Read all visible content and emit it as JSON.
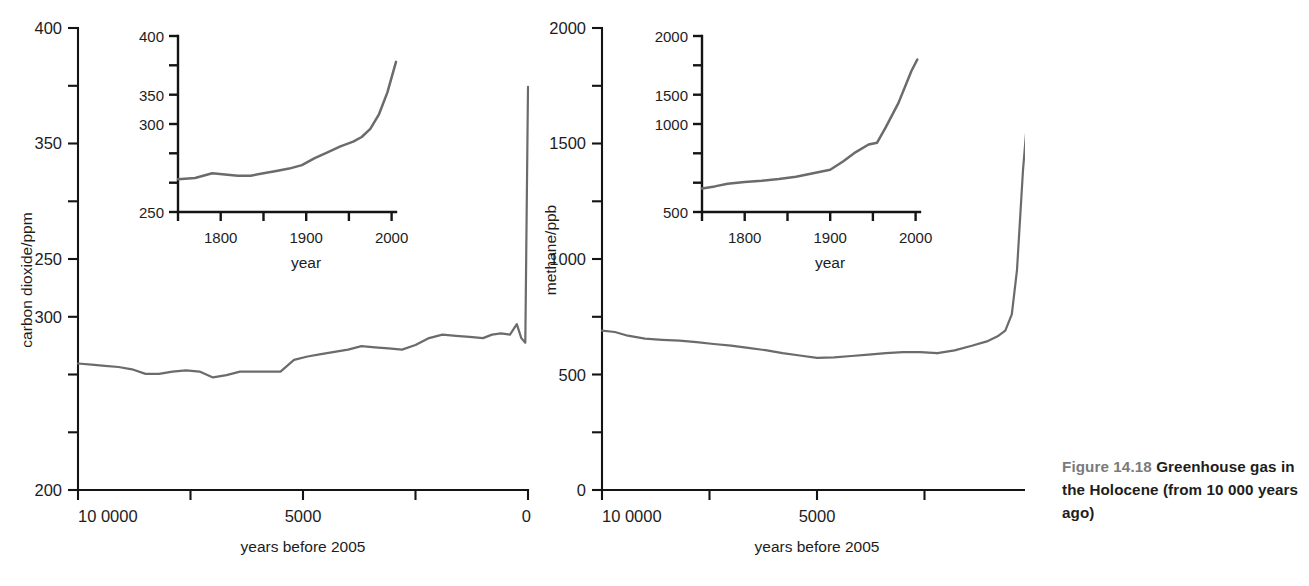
{
  "caption": {
    "figure_number": "Figure 14.18",
    "text": " Greenhouse gas in the Holocene (from 10 000 years ago)"
  },
  "chart_data": [
    {
      "id": "co2_main",
      "type": "line",
      "title": "",
      "xlabel": "years before 2005",
      "ylabel": "carbon dioxide/ppm",
      "xlim": [
        10000,
        0
      ],
      "ylim": [
        200,
        400
      ],
      "x_reversed": true,
      "grid": false,
      "legend": "none",
      "xticks": [
        10000,
        7500,
        5000,
        2500,
        0
      ],
      "xtick_labels": [
        "10 0000",
        "",
        "5000",
        "",
        "0"
      ],
      "yticks": [
        200,
        225,
        250,
        275,
        300,
        325,
        350,
        375,
        400
      ],
      "ytick_labels": [
        "200",
        "",
        "250",
        "",
        "300",
        "",
        "350",
        "",
        "400"
      ],
      "x": [
        10000,
        9700,
        9400,
        9100,
        8800,
        8500,
        8200,
        7900,
        7600,
        7300,
        7000,
        6700,
        6400,
        6100,
        5800,
        5500,
        5200,
        4900,
        4600,
        4300,
        4000,
        3700,
        3400,
        3100,
        2800,
        2500,
        2200,
        1900,
        1600,
        1300,
        1000,
        800,
        600,
        400,
        250,
        150,
        60,
        0
      ],
      "y": [
        255,
        254.5,
        254,
        253.5,
        252.5,
        250.5,
        250.5,
        251.5,
        252,
        251.5,
        249,
        250,
        251.5,
        251.5,
        251.5,
        251.5,
        256.5,
        258,
        259,
        260,
        261,
        262.5,
        262,
        261.5,
        261,
        263,
        266,
        267.5,
        267,
        266.5,
        266,
        267.5,
        268,
        267.5,
        272,
        266,
        264,
        375
      ]
    },
    {
      "id": "co2_inset",
      "type": "line",
      "title": "",
      "xlabel": "year",
      "ylabel": "",
      "xlim": [
        1750,
        2005
      ],
      "ylim": [
        250,
        400
      ],
      "grid": false,
      "legend": "none",
      "xticks": [
        1750,
        1800,
        1850,
        1900,
        1950,
        2000
      ],
      "xtick_labels": [
        "",
        "1800",
        "",
        "1900",
        "",
        "2000"
      ],
      "yticks": [
        250,
        275,
        300,
        325,
        350,
        375,
        400
      ],
      "ytick_labels": [
        "250",
        "",
        "300",
        "",
        "350",
        "",
        "400"
      ],
      "x": [
        1750,
        1770,
        1790,
        1805,
        1820,
        1835,
        1850,
        1865,
        1880,
        1895,
        1910,
        1925,
        1940,
        1955,
        1965,
        1975,
        1985,
        1995,
        2005
      ],
      "y": [
        278,
        279,
        283,
        282,
        281,
        281,
        283,
        285,
        287,
        290,
        296,
        301,
        306,
        310,
        314,
        321,
        333,
        352,
        378
      ]
    },
    {
      "id": "ch4_main",
      "type": "line",
      "title": "",
      "xlabel": "years before 2005",
      "ylabel": "methane/ppb",
      "xlim": [
        10000,
        0
      ],
      "ylim": [
        0,
        2000
      ],
      "x_reversed": true,
      "grid": false,
      "legend": "none",
      "xticks": [
        10000,
        7500,
        5000,
        2500,
        0
      ],
      "xtick_labels": [
        "10 0000",
        "",
        "5000",
        "",
        "0"
      ],
      "yticks": [
        0,
        250,
        500,
        750,
        1000,
        1250,
        1500,
        1750,
        2000
      ],
      "ytick_labels": [
        "0",
        "",
        "500",
        "",
        "1000",
        "",
        "1500",
        "",
        "2000"
      ],
      "x": [
        10000,
        9700,
        9400,
        9000,
        8600,
        8200,
        7800,
        7400,
        7000,
        6600,
        6200,
        5800,
        5400,
        5000,
        4600,
        4200,
        3800,
        3400,
        3000,
        2600,
        2200,
        1800,
        1400,
        1000,
        700,
        450,
        250,
        120,
        40,
        0
      ],
      "y": [
        690,
        684,
        668,
        655,
        650,
        646,
        640,
        632,
        625,
        615,
        605,
        592,
        582,
        572,
        574,
        580,
        586,
        592,
        597,
        597,
        592,
        598,
        610,
        625,
        645,
        663,
        690,
        760,
        1350,
        1700
      ]
    },
    {
      "id": "ch4_inset",
      "type": "line",
      "title": "",
      "xlabel": "year",
      "ylabel": "",
      "xlim": [
        1750,
        2005
      ],
      "ylim": [
        500,
        2000
      ],
      "grid": false,
      "legend": "none",
      "xticks": [
        1750,
        1800,
        1850,
        1900,
        1950,
        2000
      ],
      "xtick_labels": [
        "",
        "1800",
        "",
        "1900",
        "",
        "2000"
      ],
      "yticks": [
        500,
        750,
        1000,
        1250,
        1500,
        1750,
        2000
      ],
      "ytick_labels": [
        "500",
        "",
        "1000",
        "",
        "1500",
        "",
        "2000"
      ],
      "x": [
        1750,
        1765,
        1780,
        1800,
        1820,
        1840,
        1860,
        1880,
        1900,
        1915,
        1930,
        1945,
        1955,
        1965,
        1975,
        1985,
        1992
      ],
      "y": [
        700,
        718,
        740,
        755,
        765,
        780,
        800,
        830,
        860,
        930,
        1010,
        1075,
        1090,
        1220,
        1430,
        1700,
        1800
      ]
    }
  ]
}
